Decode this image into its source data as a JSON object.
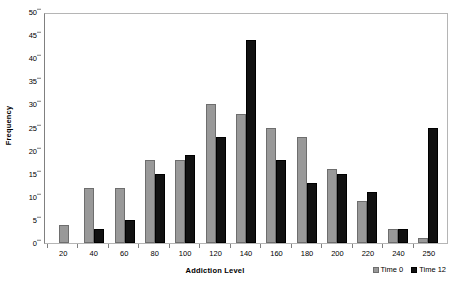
{
  "chart_data": {
    "type": "bar",
    "title": "",
    "subtitle": "",
    "xlabel": "Addiction Level",
    "ylabel": "Frequency",
    "categories": [
      "20",
      "40",
      "60",
      "80",
      "100",
      "120",
      "140",
      "160",
      "180",
      "200",
      "220",
      "240",
      "250"
    ],
    "series": [
      {
        "name": "Time 0",
        "color": "#999999",
        "values": [
          4,
          12,
          12,
          18,
          18,
          30,
          28,
          25,
          23,
          16,
          9,
          3,
          1
        ]
      },
      {
        "name": "Time 12",
        "color": "#111111",
        "values": [
          0,
          3,
          5,
          15,
          19,
          23,
          44,
          18,
          13,
          15,
          11,
          3,
          25
        ]
      }
    ],
    "ylim": [
      0,
      50
    ],
    "yticks": [
      0,
      5,
      10,
      15,
      20,
      25,
      30,
      35,
      40,
      45,
      50
    ],
    "ytick_labels": [
      "0",
      "5",
      "10",
      "15",
      "20",
      "25",
      "30",
      "35",
      "40",
      "45",
      "50"
    ],
    "grid": false,
    "legend_position": "bottom-right",
    "plot_border_color": "#b5b5b5",
    "axis_color": "#808080",
    "background": "#ffffff"
  },
  "legend": {
    "items": [
      {
        "label": "Time 0",
        "swatch": "legend-swatch-gray"
      },
      {
        "label": "Time 12",
        "swatch": "legend-swatch-black"
      }
    ]
  }
}
